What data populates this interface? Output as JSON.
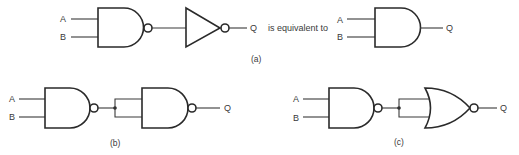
{
  "figure": {
    "colors": {
      "ink": "#2a2a2a",
      "background": "#ffffff"
    },
    "part_a": {
      "caption": "(a)",
      "connector_text": "is equivalent to",
      "left_circuit": {
        "inputs": [
          "A",
          "B"
        ],
        "output": "Q",
        "gates": [
          "NAND",
          "NOT"
        ]
      },
      "right_circuit": {
        "inputs": [
          "A",
          "B"
        ],
        "output": "Q",
        "gates": [
          "AND"
        ]
      }
    },
    "part_b": {
      "caption": "(b)",
      "inputs": [
        "A",
        "B"
      ],
      "output": "Q",
      "gates": [
        "NAND",
        "NAND (inputs tied)"
      ]
    },
    "part_c": {
      "caption": "(c)",
      "inputs": [
        "A",
        "B"
      ],
      "output": "Q",
      "gates": [
        "NAND",
        "NOR (inputs tied)"
      ]
    }
  }
}
